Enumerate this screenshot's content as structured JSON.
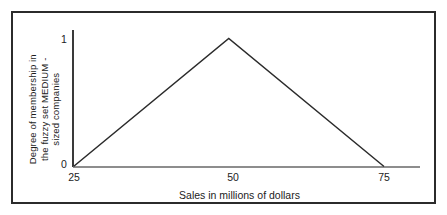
{
  "figure": {
    "border_color": "#2b2b2b",
    "background": "#ffffff"
  },
  "axes": {
    "y_label_lines": [
      "Degree of  membership in",
      "the  fuzzy set  MEDIUM -",
      "sized companies"
    ],
    "x_label": "Sales in millions of dollars",
    "y_ticks": [
      "1",
      "0"
    ],
    "x_ticks": [
      "25",
      "50",
      "75"
    ],
    "axis_line_color": "#3a3a3a",
    "x_axis_line_color": "#8d8d8d"
  },
  "chart_data": {
    "type": "line",
    "title": "",
    "subtitle": "",
    "xlabel": "Sales in millions of dollars",
    "ylabel": "Degree of membership in the fuzzy set MEDIUM - sized companies",
    "xlim": [
      25,
      80
    ],
    "ylim": [
      0,
      1
    ],
    "xticks": [
      25,
      50,
      75
    ],
    "xticklabels": [
      "25",
      "50",
      "75"
    ],
    "yticks": [
      0,
      1
    ],
    "yticklabels": [
      "0",
      "1"
    ],
    "grid": false,
    "legend": false,
    "series": [
      {
        "name": "MEDIUM-sized companies membership function",
        "shape": "triangular",
        "x": [
          25,
          50,
          75
        ],
        "y": [
          0,
          1,
          0
        ],
        "color": "#2b2b2b",
        "line_width": 1.5
      }
    ],
    "annotations": []
  }
}
